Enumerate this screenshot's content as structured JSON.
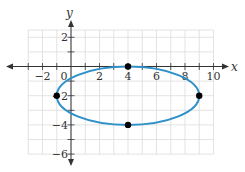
{
  "chart_data": {
    "type": "scatter",
    "title": "",
    "xlabel": "x",
    "ylabel": "y",
    "xlim": [
      -3,
      10
    ],
    "ylim": [
      -6,
      2.5
    ],
    "grid": true,
    "x_ticks": [
      -2,
      0,
      2,
      4,
      6,
      8,
      10
    ],
    "y_ticks": [
      2,
      -2,
      -4,
      -6
    ],
    "x_tick_labels": [
      "−2",
      "0",
      "2",
      "4",
      "6",
      "8",
      "10"
    ],
    "y_tick_labels": [
      "2",
      "−2",
      "−4",
      "−6"
    ],
    "curve": {
      "kind": "ellipse",
      "center": [
        4,
        -2
      ],
      "semi_major_x": 5,
      "semi_minor_y": 2,
      "equation": "(x-4)^2/25 + (y+2)^2/4 = 1",
      "color": "#2e8fc9"
    },
    "series": [
      {
        "name": "vertices and co-vertices",
        "points": [
          [
            4,
            0
          ],
          [
            -1,
            -2
          ],
          [
            9,
            -2
          ],
          [
            4,
            -4
          ]
        ],
        "color": "#000000"
      }
    ]
  },
  "colors": {
    "axis": "#333333",
    "grid": "#dcdcdc",
    "curve": "#2e8fc9",
    "points": "#000000"
  }
}
